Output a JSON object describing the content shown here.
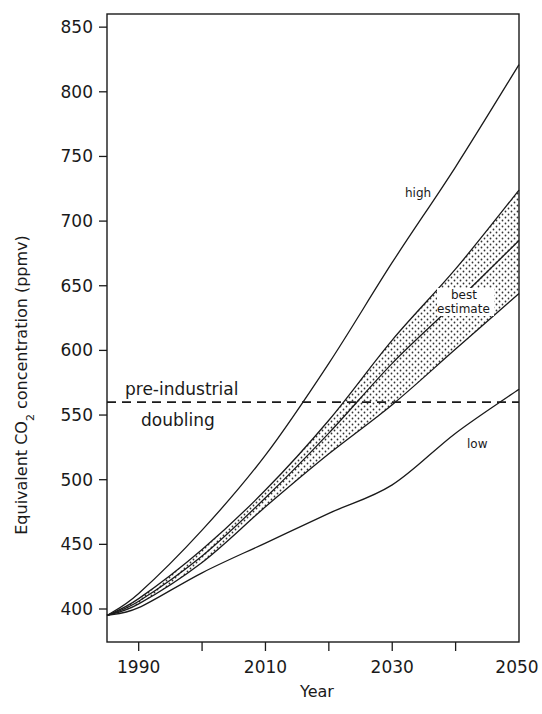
{
  "chart_data": {
    "type": "line",
    "title": "",
    "xlabel": "Year",
    "ylabel": "Equivalent CO2 concentration (ppmv)",
    "ylabel_parts": {
      "pre": "Equivalent CO",
      "sub": "2",
      "post": " concentration (ppmv)"
    },
    "xlim": [
      1985,
      2050
    ],
    "ylim": [
      392,
      868
    ],
    "x_ticks": [
      1990,
      2000,
      2010,
      2020,
      2030,
      2040,
      2050
    ],
    "x_tick_labels": [
      "1990",
      "",
      "2010",
      "",
      "2030",
      "",
      "2050"
    ],
    "y_ticks": [
      400,
      450,
      500,
      550,
      600,
      650,
      700,
      750,
      800,
      850
    ],
    "y_tick_labels": [
      "400",
      "450",
      "500",
      "550",
      "600",
      "650",
      "700",
      "750",
      "800",
      "850"
    ],
    "grid": false,
    "legend": "none (inline labels)",
    "x": [
      1985,
      1990,
      2000,
      2010,
      2020,
      2030,
      2040,
      2050
    ],
    "series": [
      {
        "name": "high",
        "style": "solid",
        "values": [
          395,
          412,
          461,
          519,
          590,
          668,
          742,
          821
        ]
      },
      {
        "name": "best estimate upper bound",
        "style": "solid",
        "values": [
          395,
          408,
          446,
          492,
          546,
          608,
          663,
          724
        ]
      },
      {
        "name": "best estimate",
        "style": "solid",
        "values": [
          395,
          406,
          441,
          486,
          536,
          590,
          637,
          685
        ]
      },
      {
        "name": "best estimate lower bound",
        "style": "solid",
        "values": [
          395,
          404,
          436,
          479,
          520,
          558,
          601,
          644
        ]
      },
      {
        "name": "low",
        "style": "solid",
        "values": [
          395,
          401,
          428,
          451,
          474,
          496,
          536,
          570
        ]
      }
    ],
    "shaded_band": {
      "between": [
        "best estimate upper bound",
        "best estimate lower bound"
      ],
      "pattern": "dotted"
    },
    "reference_line": {
      "y": 560,
      "style": "dashed",
      "label_line1": "pre-industrial",
      "label_line2": "doubling"
    },
    "annotations": [
      {
        "text": "high",
        "x": 2040,
        "y": 715
      },
      {
        "text": "best",
        "x": 2045,
        "y": 642
      },
      {
        "text": "estimate",
        "x": 2045,
        "y": 630
      },
      {
        "text": "low",
        "x": 2045,
        "y": 525
      }
    ]
  },
  "colors": {
    "line": "#1a1a1a",
    "background": "#ffffff",
    "dots": "#333333"
  }
}
